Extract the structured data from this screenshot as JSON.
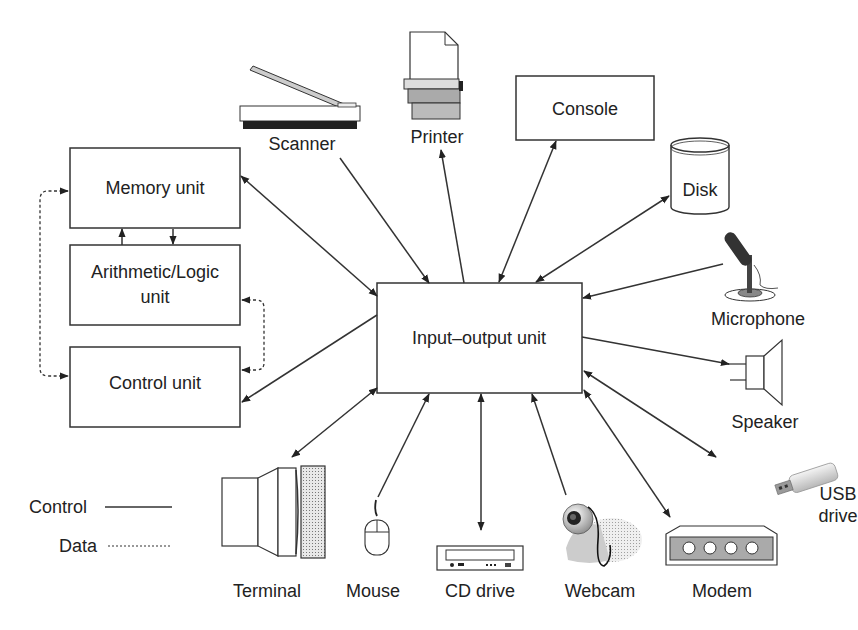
{
  "diagram": {
    "central_units": {
      "memory": "Memory unit",
      "alu_line1": "Arithmetic/Logic",
      "alu_line2": "unit",
      "control": "Control unit",
      "io": "Input–output unit"
    },
    "devices": {
      "scanner": "Scanner",
      "printer": "Printer",
      "console": "Console",
      "disk": "Disk",
      "microphone": "Microphone",
      "speaker": "Speaker",
      "usb_line1": "USB",
      "usb_line2": "drive",
      "modem": "Modem",
      "webcam": "Webcam",
      "cd_drive": "CD drive",
      "mouse": "Mouse",
      "terminal": "Terminal"
    },
    "legend": {
      "control": "Control",
      "data": "Data"
    },
    "connections": [
      {
        "from": "Scanner",
        "to": "Input-output unit",
        "direction": "to-io"
      },
      {
        "from": "Input-output unit",
        "to": "Printer",
        "direction": "from-io"
      },
      {
        "from": "Console",
        "to": "Input-output unit",
        "direction": "both"
      },
      {
        "from": "Disk",
        "to": "Input-output unit",
        "direction": "both"
      },
      {
        "from": "Microphone",
        "to": "Input-output unit",
        "direction": "to-io"
      },
      {
        "from": "Input-output unit",
        "to": "Speaker",
        "direction": "from-io"
      },
      {
        "from": "USB drive",
        "to": "Input-output unit",
        "direction": "both"
      },
      {
        "from": "Modem",
        "to": "Input-output unit",
        "direction": "both"
      },
      {
        "from": "Webcam",
        "to": "Input-output unit",
        "direction": "to-io"
      },
      {
        "from": "CD drive",
        "to": "Input-output unit",
        "direction": "both"
      },
      {
        "from": "Mouse",
        "to": "Input-output unit",
        "direction": "to-io"
      },
      {
        "from": "Terminal",
        "to": "Input-output unit",
        "direction": "both"
      },
      {
        "from": "Memory unit",
        "to": "Input-output unit",
        "direction": "both"
      },
      {
        "from": "Input-output unit",
        "to": "Control unit",
        "direction": "from-io"
      },
      {
        "from": "Memory unit",
        "to": "Arithmetic/Logic unit",
        "direction": "both"
      },
      {
        "from": "Memory unit",
        "to": "Control unit",
        "direction": "both",
        "style": "dashed"
      },
      {
        "from": "Arithmetic/Logic unit",
        "to": "Control unit",
        "direction": "both",
        "style": "dashed"
      }
    ]
  }
}
